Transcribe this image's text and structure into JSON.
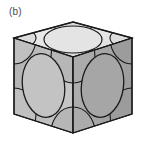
{
  "figure": {
    "panel_label": "(b)",
    "caption_text": "",
    "background_color": "#ffffff"
  },
  "colors": {
    "top_face": "#e6e6e6",
    "left_face": "#bdbdbd",
    "right_face": "#ababab",
    "sphere_light": "#d0d0d0",
    "sphere_mid": "#b4b4b4",
    "sphere_dark": "#9e9e9e",
    "outline": "#1a1a1a",
    "label_text": "#4a4a4a"
  },
  "geometry": {
    "cube_vertices": {
      "top_back": [
        73,
        22
      ],
      "top_left": [
        14,
        38
      ],
      "top_right": [
        132,
        38
      ],
      "top_front": [
        73,
        57
      ],
      "bottom_left": [
        14,
        114
      ],
      "bottom_right": [
        132,
        114
      ],
      "bottom_front": [
        73,
        133
      ]
    },
    "face_count": 3,
    "visible_faces": [
      "top",
      "left-front",
      "right-front"
    ],
    "atoms_per_visible_face": {
      "face_center_atoms": 3,
      "corner_quarter_atoms_per_face": 4
    }
  },
  "structure_data": {
    "type": "crystal-unit-cell",
    "lattice": "face-centered cubic (FCC)",
    "representation": "hard-sphere model",
    "corner_atoms": 8,
    "face_atoms": 6,
    "atoms_per_cell": 4,
    "coordination_number": 12,
    "packing_fraction": 0.74
  }
}
